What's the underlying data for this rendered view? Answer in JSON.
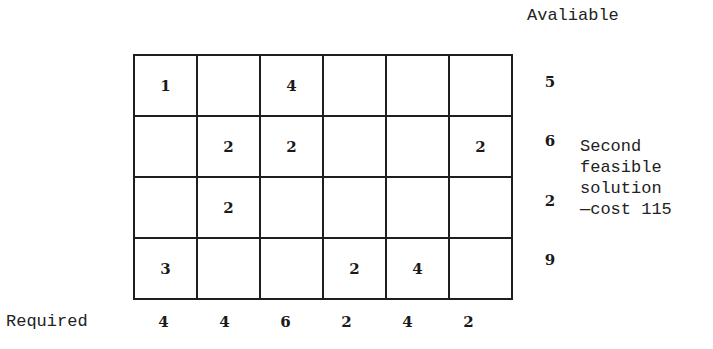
{
  "header": {
    "available_label": "Avaliable"
  },
  "grid": {
    "rows": [
      [
        "1",
        "",
        "4",
        "",
        "",
        ""
      ],
      [
        "",
        "2",
        "2",
        "",
        "",
        "2"
      ],
      [
        "",
        "2",
        "",
        "",
        "",
        ""
      ],
      [
        "3",
        "",
        "",
        "2",
        "4",
        ""
      ]
    ]
  },
  "available": [
    "5",
    "6",
    "2",
    "9"
  ],
  "required": {
    "label": "Required",
    "values": [
      "4",
      "4",
      "6",
      "2",
      "4",
      "2"
    ]
  },
  "note": {
    "lines": [
      "Second",
      "feasible",
      "solution",
      "—cost 115"
    ]
  }
}
